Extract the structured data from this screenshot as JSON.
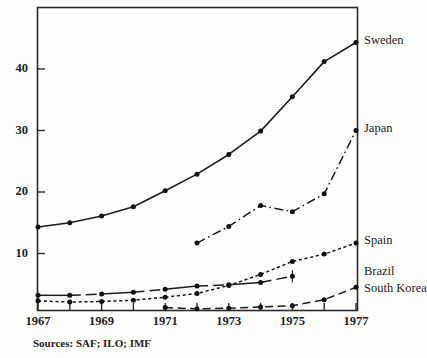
{
  "chart_data": {
    "type": "line",
    "title": "",
    "xlabel": "",
    "ylabel": "",
    "xlim": [
      1967,
      1977
    ],
    "ylim": [
      0,
      47
    ],
    "yticks": [
      10,
      20,
      30,
      40
    ],
    "xticks": [
      1967,
      1968,
      1969,
      1970,
      1971,
      1972,
      1973,
      1974,
      1975,
      1976,
      1977
    ],
    "xtick_labels": [
      "1967",
      "",
      "1969",
      "",
      "1971",
      "",
      "1973",
      "",
      "1975",
      "",
      "1977"
    ],
    "grid": false,
    "legend_position": "right-of-axes-inline",
    "series": [
      {
        "name": "Sweden",
        "line_style": "solid",
        "marker": "filled-circle",
        "x": [
          1967,
          1968,
          1969,
          1970,
          1971,
          1972,
          1973,
          1974,
          1975,
          1976,
          1977
        ],
        "values": [
          14.3,
          15.0,
          16.1,
          17.6,
          20.2,
          22.9,
          26.1,
          29.9,
          35.5,
          41.2,
          44.3
        ]
      },
      {
        "name": "Japan",
        "line_style": "dash-dot",
        "marker": "filled-circle",
        "x": [
          1972,
          1973,
          1974,
          1975,
          1976,
          1977
        ],
        "values": [
          11.7,
          14.4,
          17.8,
          16.8,
          19.7,
          30.0
        ]
      },
      {
        "name": "Spain",
        "line_style": "dotted",
        "marker": "filled-circle",
        "x": [
          1967,
          1968,
          1969,
          1970,
          1971,
          1972,
          1973,
          1974,
          1975,
          1976,
          1977
        ],
        "values": [
          2.3,
          2.1,
          2.2,
          2.4,
          2.9,
          3.5,
          4.8,
          6.6,
          8.7,
          9.9,
          11.7
        ]
      },
      {
        "name": "Brazil",
        "line_style": "solid-long-dash",
        "marker": "filled-circle",
        "x": [
          1967,
          1968,
          1969,
          1970,
          1971,
          1972,
          1973,
          1974,
          1975
        ],
        "values": [
          3.2,
          3.2,
          3.4,
          3.7,
          4.2,
          4.7,
          4.9,
          5.3,
          6.3
        ]
      },
      {
        "name": "South Korea",
        "line_style": "long-dash",
        "marker": "filled-circle",
        "x": [
          1971,
          1972,
          1973,
          1974,
          1975,
          1976,
          1977
        ],
        "values": [
          1.2,
          1.0,
          1.1,
          1.3,
          1.5,
          2.5,
          4.5
        ]
      }
    ],
    "annotations": {
      "source": "Sources: SAF; ILO; IMF"
    }
  },
  "axes": {
    "y_tick_labels": [
      "40",
      "30",
      "20",
      "10"
    ],
    "x_tick_labels": [
      "1967",
      "1969",
      "1971",
      "1973",
      "1975",
      "1977"
    ]
  },
  "series_labels": [
    {
      "text": "Sweden"
    },
    {
      "text": "Japan"
    },
    {
      "text": "Spain"
    },
    {
      "text": "Brazil"
    },
    {
      "text": "South Korea"
    }
  ],
  "footer": {
    "source": "Sources: SAF; ILO; IMF"
  }
}
